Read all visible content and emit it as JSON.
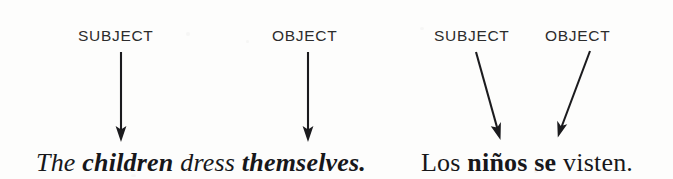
{
  "figure": {
    "kind": "grammar-diagram",
    "background_color": "#fdfdfc",
    "ink_color": "#17171a",
    "label_color": "#2c2c2c"
  },
  "english": {
    "labels": {
      "subject": "SUBJECT",
      "object": "OBJECT"
    },
    "sentence": {
      "full_text": "The children dress themselves.",
      "words": [
        {
          "text": "The",
          "bold": false
        },
        {
          "text": "children",
          "bold": true
        },
        {
          "text": "dress",
          "bold": false
        },
        {
          "text": "themselves.",
          "bold": true
        }
      ]
    },
    "arrows": [
      {
        "name": "subject-arrow",
        "from_label": "SUBJECT",
        "to_word": "children",
        "direction": "vertical-down"
      },
      {
        "name": "object-arrow",
        "from_label": "OBJECT",
        "to_word": "themselves",
        "direction": "vertical-down"
      }
    ]
  },
  "spanish": {
    "labels": {
      "subject": "SUBJECT",
      "object": "OBJECT"
    },
    "sentence": {
      "full_text": "Los niños se visten.",
      "words": [
        {
          "text": "Los",
          "bold": false
        },
        {
          "text": "niños",
          "bold": true
        },
        {
          "text": "se",
          "bold": true
        },
        {
          "text": "visten.",
          "bold": false
        }
      ]
    },
    "arrows": [
      {
        "name": "subject-arrow",
        "from_label": "SUBJECT",
        "to_word": "niños",
        "direction": "diagonal-down-right"
      },
      {
        "name": "object-arrow",
        "from_label": "OBJECT",
        "to_word": "se",
        "direction": "diagonal-down-left"
      }
    ]
  }
}
